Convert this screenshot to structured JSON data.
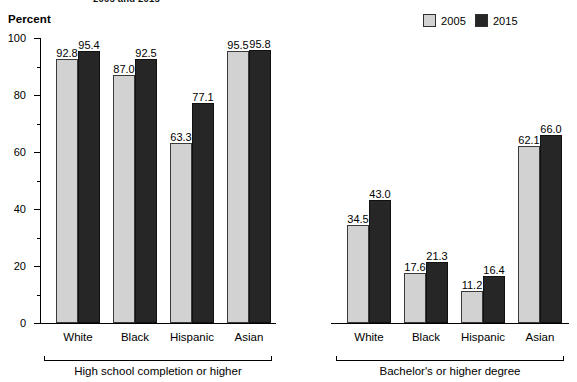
{
  "title_fragment": "2005 and 2015",
  "axis_caption": "Percent",
  "legend": {
    "items": [
      {
        "label": "2005",
        "color": "#d2d2d2"
      },
      {
        "label": "2015",
        "color": "#262626"
      }
    ]
  },
  "yaxis": {
    "ticks": [
      "0",
      "20",
      "40",
      "60",
      "80",
      "100"
    ]
  },
  "groups": [
    {
      "label": "High school completion or higher"
    },
    {
      "label": "Bachelor's or higher degree"
    }
  ],
  "chart_data": {
    "type": "bar",
    "title": "2005 and 2015",
    "xlabel": "",
    "ylabel": "Percent",
    "ylim": [
      0,
      100
    ],
    "grid": false,
    "legend_position": "top-right",
    "panels": [
      {
        "name": "High school completion or higher",
        "categories": [
          "White",
          "Black",
          "Hispanic",
          "Asian"
        ],
        "series": [
          {
            "name": "2005",
            "color": "#d2d2d2",
            "values": [
              92.8,
              87.0,
              63.3,
              95.5
            ]
          },
          {
            "name": "2015",
            "color": "#262626",
            "values": [
              95.4,
              92.5,
              77.1,
              95.8
            ]
          }
        ]
      },
      {
        "name": "Bachelor's or higher degree",
        "categories": [
          "White",
          "Black",
          "Hispanic",
          "Asian"
        ],
        "series": [
          {
            "name": "2005",
            "color": "#d2d2d2",
            "values": [
              34.5,
              17.6,
              11.2,
              62.1
            ]
          },
          {
            "name": "2015",
            "color": "#262626",
            "values": [
              43.0,
              21.3,
              16.4,
              66.0
            ]
          }
        ]
      }
    ],
    "value_labels": {
      "panel0": {
        "2005": [
          "92.8",
          "87.0",
          "63.3",
          "95.5"
        ],
        "2015": [
          "95.4",
          "92.5",
          "77.1",
          "95.8"
        ]
      },
      "panel1": {
        "2005": [
          "34.5",
          "17.6",
          "11.2",
          "62.1"
        ],
        "2015": [
          "43.0",
          "21.3",
          "16.4",
          "66.0"
        ]
      }
    }
  }
}
